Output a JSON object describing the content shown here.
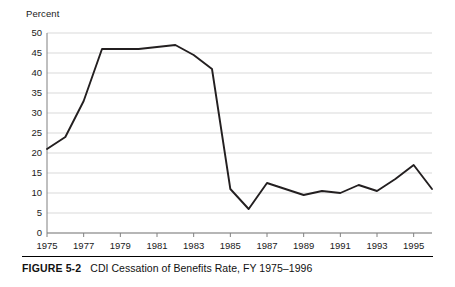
{
  "figure": {
    "number_label": "FIGURE 5-2",
    "title": "CDI Cessation of Benefits Rate, FY 1975–1996"
  },
  "axes": {
    "y_axis_title": "Percent",
    "y_tick_labels": [
      "50",
      "45",
      "40",
      "35",
      "30",
      "25",
      "20",
      "15",
      "10",
      "5",
      "0"
    ],
    "x_tick_labels": [
      "1975",
      "1977",
      "1979",
      "1981",
      "1983",
      "1985",
      "1987",
      "1989",
      "1991",
      "1993",
      "1995"
    ]
  },
  "colors": {
    "line": "#231f20",
    "gridline": "#d9d9d9",
    "axis": "#808080",
    "text": "#1a1a1a",
    "background": "#ffffff"
  },
  "chart_data": {
    "type": "line",
    "title": "CDI Cessation of Benefits Rate, FY 1975–1996",
    "xlabel": "",
    "ylabel": "Percent",
    "xlim": [
      1975,
      1996
    ],
    "ylim": [
      0,
      50
    ],
    "ytick_interval": 5,
    "xtick_interval": 2,
    "grid": "horizontal",
    "legend": "none",
    "x": [
      1975,
      1976,
      1977,
      1978,
      1979,
      1980,
      1981,
      1982,
      1983,
      1984,
      1985,
      1986,
      1987,
      1988,
      1989,
      1990,
      1991,
      1992,
      1993,
      1994,
      1995,
      1996
    ],
    "values": [
      21,
      24,
      33,
      46,
      46,
      46,
      46.5,
      47,
      44.5,
      41,
      11,
      6,
      12.5,
      11,
      9.5,
      10.5,
      10,
      12,
      10.5,
      13.5,
      17,
      11
    ],
    "series": [
      {
        "name": "CDI Cessation of Benefits Rate",
        "values": [
          21,
          24,
          33,
          46,
          46,
          46,
          46.5,
          47,
          44.5,
          41,
          11,
          6,
          12.5,
          11,
          9.5,
          10.5,
          10,
          12,
          10.5,
          13.5,
          17,
          11
        ]
      }
    ]
  }
}
